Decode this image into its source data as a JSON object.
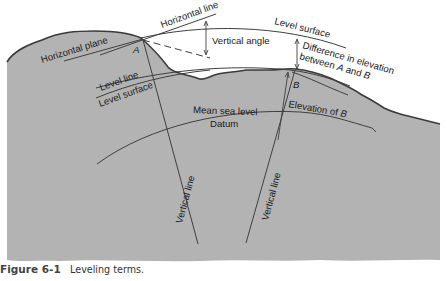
{
  "figure": {
    "number": "Figure 6-1",
    "caption": "Leveling terms.",
    "colors": {
      "ground": "#b3b3b3",
      "ground_outline": "#3a3a3a",
      "lines": "#3f3f3f",
      "background": "#ffffff"
    },
    "labels": {
      "horizontal_line": "Horizontal line",
      "horizontal_plane": "Horizontal plane",
      "point_a": "A",
      "vertical_angle": "Vertical angle",
      "level_surface_top": "Level surface",
      "difference_line1": "Difference in elevation",
      "difference_line2_prefix": "between ",
      "difference_a": "A",
      "difference_and": " and ",
      "difference_b": "B",
      "point_b": "B",
      "level_line": "Level line",
      "level_surface": "Level surface",
      "mean_sea_level": "Mean sea level",
      "datum": "Datum",
      "elevation_of_prefix": "Elevation of ",
      "elevation_of_b": "B",
      "vertical_line_left": "Vertical line",
      "vertical_line_right": "Vertical line"
    }
  }
}
